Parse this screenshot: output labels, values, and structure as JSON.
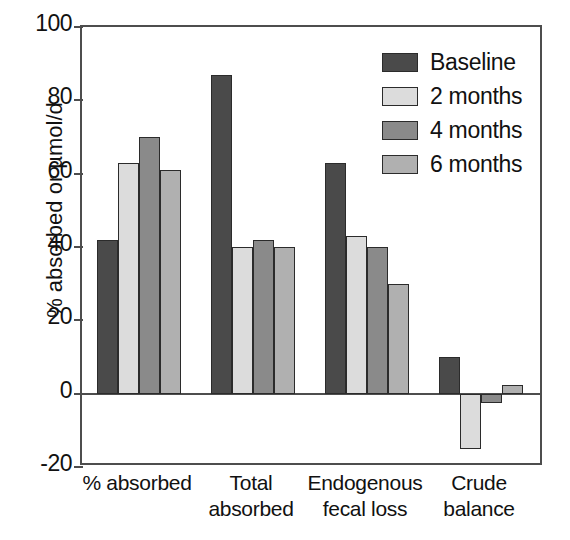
{
  "chart_data": {
    "type": "bar",
    "title": "",
    "xlabel": "",
    "ylabel": "% absorbed or µmol/d",
    "ylim": [
      -20,
      100
    ],
    "yticks": [
      -20,
      0,
      20,
      40,
      60,
      80,
      100
    ],
    "ytick_labels": [
      "-20",
      "0",
      "20",
      "40",
      "60",
      "80",
      "100"
    ],
    "grid": false,
    "legend_position": "top-right",
    "categories": [
      "% absorbed",
      "Total\nabsorbed",
      "Endogenous\nfecal loss",
      "Crude\nbalance"
    ],
    "series": [
      {
        "name": "Baseline",
        "color": "#4a4a4a",
        "values": [
          42,
          87,
          63,
          10
        ]
      },
      {
        "name": "2 months",
        "color": "#dcdcdc",
        "values": [
          63,
          40,
          43,
          -15
        ]
      },
      {
        "name": "4 months",
        "color": "#8a8a8a",
        "values": [
          70,
          42,
          40,
          -2.5
        ]
      },
      {
        "name": "6 months",
        "color": "#b0b0b0",
        "values": [
          61,
          40,
          30,
          2.5
        ]
      }
    ]
  },
  "axis": {
    "frame_color": "#4d4d4d",
    "text_color": "#111111"
  }
}
